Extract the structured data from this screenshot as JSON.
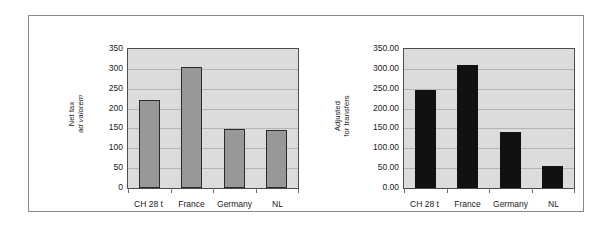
{
  "figure": {
    "border_color": "#8a8a8a",
    "background": "#ffffff"
  },
  "chart_data": [
    {
      "id": "net-tax-ad-valorem",
      "type": "bar",
      "title": "",
      "xlabel": "",
      "ylabel": "Net tax ad valorem",
      "ylabel_lines": [
        "Net tax",
        "ad valorem"
      ],
      "categories": [
        "CH 28 t",
        "France",
        "Germany",
        "NL"
      ],
      "values": [
        222,
        305,
        149,
        145
      ],
      "ylim": [
        0,
        350
      ],
      "yticks": [
        350,
        300,
        250,
        200,
        150,
        100,
        50,
        0
      ],
      "ytick_labels": [
        "350",
        "300",
        "250",
        "200",
        "150",
        "100",
        "50",
        "0"
      ],
      "grid": true,
      "legend": null,
      "bar_color": "#989898",
      "bar_edge_color": "#2b2b2b",
      "plot_background": "#dcdcdc"
    },
    {
      "id": "adjusted-for-transfers",
      "type": "bar",
      "title": "",
      "xlabel": "",
      "ylabel": "Adjusted for transfers",
      "ylabel_lines": [
        "Adjusted",
        "for transfers"
      ],
      "categories": [
        "CH 28 t",
        "France",
        "Germany",
        "NL"
      ],
      "values": [
        247,
        311,
        142,
        55
      ],
      "ylim": [
        0,
        350
      ],
      "yticks": [
        350,
        300,
        250,
        200,
        150,
        100,
        50,
        0
      ],
      "ytick_labels": [
        "350.00",
        "300.00",
        "250.00",
        "200.00",
        "150.00",
        "100.00",
        "50.00",
        "0.00"
      ],
      "grid": true,
      "legend": null,
      "bar_color": "#111111",
      "bar_edge_color": "#111111",
      "plot_background": "#dcdcdc"
    }
  ]
}
